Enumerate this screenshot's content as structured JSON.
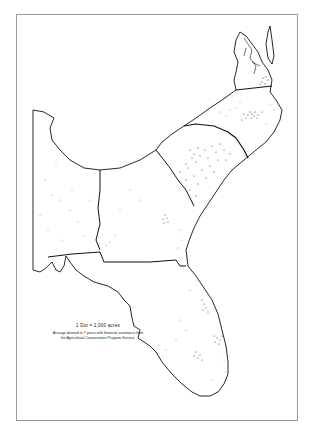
{
  "map": {
    "title": "",
    "legend": {
      "scale": "1 Dot = 2,000 acres",
      "caption": "Acreage drained in 7 years with financial assistance from the Agricultural Conservation Program Service."
    },
    "regions": [
      "Virginia (eastern)",
      "North Carolina",
      "South Carolina",
      "Georgia",
      "Alabama",
      "Florida"
    ],
    "colors": {
      "background": "#ffffff",
      "outline": "#111111",
      "frame": "#9a9a9a",
      "dots": "#222222"
    }
  }
}
